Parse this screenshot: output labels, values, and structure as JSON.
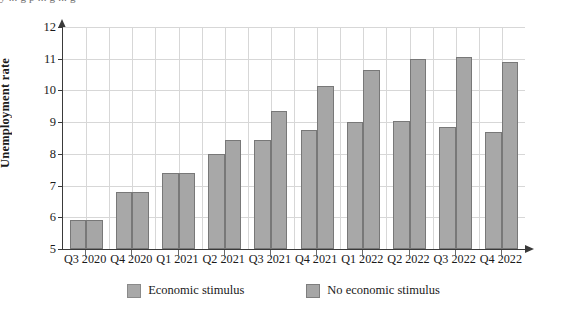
{
  "top_text": "y ... g p ... g ... g",
  "chart_data": {
    "type": "bar",
    "title": "",
    "xlabel": "",
    "ylabel": "Unemployment rate",
    "ylim": [
      5,
      12
    ],
    "yticks": [
      5,
      6,
      7,
      8,
      9,
      10,
      11,
      12
    ],
    "grid": true,
    "legend_position": "bottom",
    "categories": [
      "Q3 2020",
      "Q4 2020",
      "Q1 2021",
      "Q2 2021",
      "Q3 2021",
      "Q4 2021",
      "Q1 2022",
      "Q2 2022",
      "Q3 2022",
      "Q4 2022"
    ],
    "series": [
      {
        "name": "Economic stimulus",
        "color": "#a8a8a8",
        "values": [
          5.9,
          6.8,
          7.4,
          8.0,
          8.45,
          8.75,
          9.0,
          9.05,
          8.85,
          8.7
        ]
      },
      {
        "name": "No economic stimulus",
        "color": "#a6a6a6",
        "values": [
          5.9,
          6.8,
          7.4,
          8.45,
          9.35,
          10.15,
          10.65,
          11.0,
          11.05,
          10.9
        ]
      }
    ]
  },
  "legend": {
    "items": [
      {
        "label": "Economic stimulus"
      },
      {
        "label": "No economic stimulus"
      }
    ]
  }
}
